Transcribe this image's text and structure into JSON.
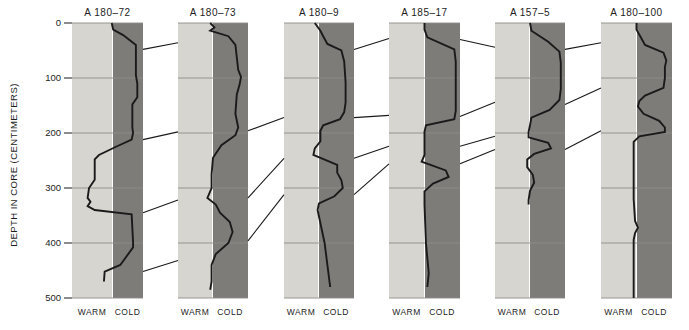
{
  "figure": {
    "y_axis_title": "DEPTH IN CORE (CENTIMETERS)",
    "footer_warm": "WARM",
    "footer_cold": "COLD"
  },
  "chart_data": {
    "type": "line",
    "title": "",
    "xlabel": "",
    "ylabel": "DEPTH IN CORE (CENTIMETERS)",
    "ylim": [
      0,
      500
    ],
    "y_ticks": [
      0,
      100,
      200,
      300,
      400,
      500
    ],
    "y_tick_labels": [
      "0",
      "100",
      "200",
      "300",
      "400",
      "500"
    ],
    "grid": true,
    "legend": null,
    "axis_direction": "depth increases downward",
    "x_category_labels": [
      "WARM",
      "COLD"
    ],
    "x_description": "Horizontal position of curve indicates paleoclimate: left = WARM (light band), right = COLD (dark band)",
    "panel_bands": {
      "warm_color": "#d7d5d0",
      "cold_color": "#7e7c79",
      "curve_color": "#1a1a1a",
      "grid_color": "#8e8c88",
      "correlation_line_color": "#1a1a1a"
    },
    "panels": [
      {
        "name": "A 180-72",
        "x0": 72,
        "x1": 143,
        "split": 112,
        "curve_end_depth": 470,
        "series": [
          {
            "depth": 0,
            "x": 0.56
          },
          {
            "depth": 12,
            "x": 0.58
          },
          {
            "depth": 22,
            "x": 0.72
          },
          {
            "depth": 40,
            "x": 0.9
          },
          {
            "depth": 95,
            "x": 0.9
          },
          {
            "depth": 110,
            "x": 0.92
          },
          {
            "depth": 135,
            "x": 0.92
          },
          {
            "depth": 148,
            "x": 0.85
          },
          {
            "depth": 190,
            "x": 0.85
          },
          {
            "depth": 200,
            "x": 0.86
          },
          {
            "depth": 212,
            "x": 0.84
          },
          {
            "depth": 225,
            "x": 0.62
          },
          {
            "depth": 240,
            "x": 0.38
          },
          {
            "depth": 248,
            "x": 0.32
          },
          {
            "depth": 285,
            "x": 0.32
          },
          {
            "depth": 300,
            "x": 0.24
          },
          {
            "depth": 318,
            "x": 0.22
          },
          {
            "depth": 325,
            "x": 0.26
          },
          {
            "depth": 333,
            "x": 0.22
          },
          {
            "depth": 340,
            "x": 0.32
          },
          {
            "depth": 348,
            "x": 0.84
          },
          {
            "depth": 398,
            "x": 0.86
          },
          {
            "depth": 408,
            "x": 0.86
          },
          {
            "depth": 440,
            "x": 0.68
          },
          {
            "depth": 452,
            "x": 0.46
          },
          {
            "depth": 470,
            "x": 0.45
          }
        ]
      },
      {
        "name": "A 180-73",
        "x0": 178,
        "x1": 248,
        "split": 212,
        "curve_end_depth": 485,
        "series": [
          {
            "depth": 0,
            "x": 0.46
          },
          {
            "depth": 8,
            "x": 0.52
          },
          {
            "depth": 14,
            "x": 0.46
          },
          {
            "depth": 24,
            "x": 0.72
          },
          {
            "depth": 40,
            "x": 0.82
          },
          {
            "depth": 85,
            "x": 0.86
          },
          {
            "depth": 98,
            "x": 0.9
          },
          {
            "depth": 112,
            "x": 0.88
          },
          {
            "depth": 130,
            "x": 0.84
          },
          {
            "depth": 165,
            "x": 0.82
          },
          {
            "depth": 190,
            "x": 0.86
          },
          {
            "depth": 204,
            "x": 0.82
          },
          {
            "depth": 222,
            "x": 0.62
          },
          {
            "depth": 245,
            "x": 0.5
          },
          {
            "depth": 275,
            "x": 0.48
          },
          {
            "depth": 300,
            "x": 0.48
          },
          {
            "depth": 318,
            "x": 0.42
          },
          {
            "depth": 330,
            "x": 0.54
          },
          {
            "depth": 345,
            "x": 0.6
          },
          {
            "depth": 362,
            "x": 0.74
          },
          {
            "depth": 380,
            "x": 0.78
          },
          {
            "depth": 400,
            "x": 0.72
          },
          {
            "depth": 420,
            "x": 0.54
          },
          {
            "depth": 440,
            "x": 0.48
          },
          {
            "depth": 470,
            "x": 0.48
          },
          {
            "depth": 485,
            "x": 0.46
          }
        ]
      },
      {
        "name": "A 180-9",
        "x0": 284,
        "x1": 354,
        "split": 318,
        "curve_end_depth": 480,
        "series": [
          {
            "depth": 0,
            "x": 0.44
          },
          {
            "depth": 14,
            "x": 0.52
          },
          {
            "depth": 24,
            "x": 0.56
          },
          {
            "depth": 38,
            "x": 0.62
          },
          {
            "depth": 50,
            "x": 0.82
          },
          {
            "depth": 70,
            "x": 0.86
          },
          {
            "depth": 108,
            "x": 0.88
          },
          {
            "depth": 145,
            "x": 0.88
          },
          {
            "depth": 162,
            "x": 0.86
          },
          {
            "depth": 175,
            "x": 0.8
          },
          {
            "depth": 186,
            "x": 0.56
          },
          {
            "depth": 196,
            "x": 0.52
          },
          {
            "depth": 215,
            "x": 0.52
          },
          {
            "depth": 228,
            "x": 0.44
          },
          {
            "depth": 240,
            "x": 0.42
          },
          {
            "depth": 258,
            "x": 0.76
          },
          {
            "depth": 272,
            "x": 0.76
          },
          {
            "depth": 286,
            "x": 0.82
          },
          {
            "depth": 300,
            "x": 0.84
          },
          {
            "depth": 315,
            "x": 0.72
          },
          {
            "depth": 328,
            "x": 0.5
          },
          {
            "depth": 340,
            "x": 0.48
          },
          {
            "depth": 400,
            "x": 0.58
          },
          {
            "depth": 480,
            "x": 0.66
          }
        ]
      },
      {
        "name": "A 185-17",
        "x0": 389,
        "x1": 460,
        "split": 424,
        "curve_end_depth": 480,
        "series": [
          {
            "depth": 0,
            "x": 0.5
          },
          {
            "depth": 12,
            "x": 0.5
          },
          {
            "depth": 26,
            "x": 0.54
          },
          {
            "depth": 48,
            "x": 0.92
          },
          {
            "depth": 70,
            "x": 0.94
          },
          {
            "depth": 90,
            "x": 0.94
          },
          {
            "depth": 112,
            "x": 0.94
          },
          {
            "depth": 140,
            "x": 0.94
          },
          {
            "depth": 160,
            "x": 0.94
          },
          {
            "depth": 175,
            "x": 0.92
          },
          {
            "depth": 186,
            "x": 0.52
          },
          {
            "depth": 198,
            "x": 0.5
          },
          {
            "depth": 225,
            "x": 0.5
          },
          {
            "depth": 240,
            "x": 0.5
          },
          {
            "depth": 252,
            "x": 0.46
          },
          {
            "depth": 268,
            "x": 0.8
          },
          {
            "depth": 280,
            "x": 0.84
          },
          {
            "depth": 292,
            "x": 0.62
          },
          {
            "depth": 306,
            "x": 0.5
          },
          {
            "depth": 330,
            "x": 0.5
          },
          {
            "depth": 400,
            "x": 0.52
          },
          {
            "depth": 455,
            "x": 0.56
          },
          {
            "depth": 480,
            "x": 0.54
          }
        ]
      },
      {
        "name": "A 157-5",
        "x0": 495,
        "x1": 565,
        "split": 529,
        "curve_end_depth": 330,
        "series": [
          {
            "depth": 0,
            "x": 0.5
          },
          {
            "depth": 14,
            "x": 0.52
          },
          {
            "depth": 34,
            "x": 0.76
          },
          {
            "depth": 52,
            "x": 0.92
          },
          {
            "depth": 72,
            "x": 0.94
          },
          {
            "depth": 100,
            "x": 0.94
          },
          {
            "depth": 120,
            "x": 0.94
          },
          {
            "depth": 140,
            "x": 0.92
          },
          {
            "depth": 158,
            "x": 0.78
          },
          {
            "depth": 172,
            "x": 0.52
          },
          {
            "depth": 186,
            "x": 0.5
          },
          {
            "depth": 198,
            "x": 0.48
          },
          {
            "depth": 208,
            "x": 0.48
          },
          {
            "depth": 218,
            "x": 0.76
          },
          {
            "depth": 228,
            "x": 0.8
          },
          {
            "depth": 238,
            "x": 0.56
          },
          {
            "depth": 248,
            "x": 0.46
          },
          {
            "depth": 262,
            "x": 0.46
          },
          {
            "depth": 276,
            "x": 0.54
          },
          {
            "depth": 290,
            "x": 0.56
          },
          {
            "depth": 305,
            "x": 0.5
          },
          {
            "depth": 322,
            "x": 0.48
          },
          {
            "depth": 330,
            "x": 0.48
          }
        ]
      },
      {
        "name": "A 180-100",
        "x0": 601,
        "x1": 672,
        "split": 636,
        "curve_end_depth": 500,
        "series": [
          {
            "depth": 0,
            "x": 0.5
          },
          {
            "depth": 12,
            "x": 0.5
          },
          {
            "depth": 26,
            "x": 0.56
          },
          {
            "depth": 40,
            "x": 0.62
          },
          {
            "depth": 54,
            "x": 0.88
          },
          {
            "depth": 68,
            "x": 0.92
          },
          {
            "depth": 80,
            "x": 0.9
          },
          {
            "depth": 100,
            "x": 0.9
          },
          {
            "depth": 118,
            "x": 0.88
          },
          {
            "depth": 132,
            "x": 0.62
          },
          {
            "depth": 142,
            "x": 0.54
          },
          {
            "depth": 152,
            "x": 0.52
          },
          {
            "depth": 165,
            "x": 0.6
          },
          {
            "depth": 178,
            "x": 0.82
          },
          {
            "depth": 190,
            "x": 0.9
          },
          {
            "depth": 198,
            "x": 0.9
          },
          {
            "depth": 206,
            "x": 0.54
          },
          {
            "depth": 216,
            "x": 0.46
          },
          {
            "depth": 260,
            "x": 0.46
          },
          {
            "depth": 320,
            "x": 0.46
          },
          {
            "depth": 360,
            "x": 0.48
          },
          {
            "depth": 372,
            "x": 0.52
          },
          {
            "depth": 382,
            "x": 0.48
          },
          {
            "depth": 394,
            "x": 0.46
          },
          {
            "depth": 420,
            "x": 0.46
          },
          {
            "depth": 470,
            "x": 0.46
          },
          {
            "depth": 500,
            "x": 0.46
          }
        ]
      }
    ],
    "correlation_lines": [
      {
        "from_panel": 0,
        "from_depth": 48,
        "to_panel": 1,
        "to_depth": 36
      },
      {
        "from_panel": 0,
        "from_depth": 212,
        "to_panel": 1,
        "to_depth": 198
      },
      {
        "from_panel": 0,
        "from_depth": 345,
        "to_panel": 1,
        "to_depth": 322
      },
      {
        "from_panel": 0,
        "from_depth": 452,
        "to_panel": 1,
        "to_depth": 432
      },
      {
        "from_panel": 1,
        "from_depth": 196,
        "to_panel": 2,
        "to_depth": 172
      },
      {
        "from_panel": 1,
        "from_depth": 318,
        "to_panel": 2,
        "to_depth": 246
      },
      {
        "from_panel": 1,
        "from_depth": 396,
        "to_panel": 2,
        "to_depth": 312
      },
      {
        "from_panel": 2,
        "from_depth": 48,
        "to_panel": 3,
        "to_depth": 28
      },
      {
        "from_panel": 2,
        "from_depth": 172,
        "to_panel": 3,
        "to_depth": 168
      },
      {
        "from_panel": 2,
        "from_depth": 246,
        "to_panel": 3,
        "to_depth": 224
      },
      {
        "from_panel": 2,
        "from_depth": 312,
        "to_panel": 3,
        "to_depth": 256
      },
      {
        "from_panel": 3,
        "from_depth": 30,
        "to_panel": 4,
        "to_depth": 44
      },
      {
        "from_panel": 3,
        "from_depth": 170,
        "to_panel": 4,
        "to_depth": 144
      },
      {
        "from_panel": 3,
        "from_depth": 224,
        "to_panel": 4,
        "to_depth": 206
      },
      {
        "from_panel": 3,
        "from_depth": 256,
        "to_panel": 4,
        "to_depth": 230
      },
      {
        "from_panel": 4,
        "from_depth": 48,
        "to_panel": 5,
        "to_depth": 36
      },
      {
        "from_panel": 4,
        "from_depth": 148,
        "to_panel": 5,
        "to_depth": 118
      },
      {
        "from_panel": 4,
        "from_depth": 230,
        "to_panel": 5,
        "to_depth": 196
      }
    ]
  }
}
